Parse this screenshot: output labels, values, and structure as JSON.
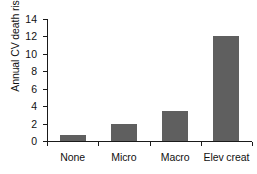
{
  "chart_data": {
    "type": "bar",
    "title": "",
    "subtitle": "",
    "xlabel": "",
    "ylabel": "Annual CV death risk (%)",
    "categories": [
      "None",
      "Micro",
      "Macro",
      "Elev creat"
    ],
    "values": [
      0.65,
      1.9,
      3.4,
      12.0
    ],
    "series": [
      {
        "name": "Annual CV death risk",
        "values": [
          0.65,
          1.9,
          3.4,
          12.0
        ]
      }
    ],
    "ylim": [
      0,
      14
    ],
    "ytick_labels": [
      "0",
      "2",
      "4",
      "6",
      "8",
      "10",
      "12",
      "14"
    ],
    "ytick_values": [
      0,
      2,
      4,
      6,
      8,
      10,
      12,
      14
    ],
    "grid": false,
    "legend": false,
    "legend_position": "none",
    "annotations": [],
    "colors": {
      "bar": "#5f5f5f",
      "axis": "#1a1a1a",
      "text": "#111111",
      "background": "#ffffff"
    }
  }
}
